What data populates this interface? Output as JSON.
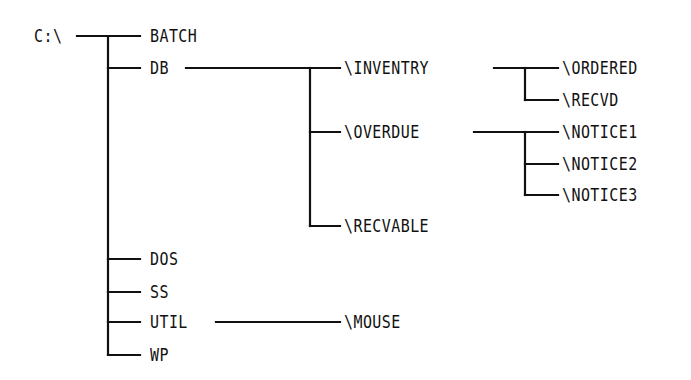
{
  "diagram": {
    "type": "directory-tree",
    "root": {
      "label": "C:\\",
      "x": 34,
      "y": 36
    },
    "nodes": [
      {
        "id": "batch",
        "label": "BATCH",
        "x": 150,
        "y": 36
      },
      {
        "id": "db",
        "label": "DB",
        "x": 150,
        "y": 68
      },
      {
        "id": "inventry",
        "label": "\\INVENTRY",
        "x": 344,
        "y": 68
      },
      {
        "id": "ordered",
        "label": "\\ORDERED",
        "x": 562,
        "y": 68
      },
      {
        "id": "recvd",
        "label": "\\RECVD",
        "x": 562,
        "y": 100
      },
      {
        "id": "overdue",
        "label": "\\OVERDUE",
        "x": 344,
        "y": 132
      },
      {
        "id": "notice1",
        "label": "\\NOTICE1",
        "x": 562,
        "y": 132
      },
      {
        "id": "notice2",
        "label": "\\NOTICE2",
        "x": 562,
        "y": 164
      },
      {
        "id": "notice3",
        "label": "\\NOTICE3",
        "x": 562,
        "y": 195
      },
      {
        "id": "recvable",
        "label": "\\RECVABLE",
        "x": 344,
        "y": 226
      },
      {
        "id": "dos",
        "label": "DOS",
        "x": 150,
        "y": 259
      },
      {
        "id": "ss",
        "label": "SS",
        "x": 150,
        "y": 292
      },
      {
        "id": "util",
        "label": "UTIL",
        "x": 150,
        "y": 322
      },
      {
        "id": "mouse",
        "label": "\\MOUSE",
        "x": 344,
        "y": 322
      },
      {
        "id": "wp",
        "label": "WP",
        "x": 150,
        "y": 355
      }
    ],
    "edges": [
      {
        "from": "C:\\",
        "to": "BATCH"
      },
      {
        "from": "C:\\",
        "to": "DB"
      },
      {
        "from": "C:\\",
        "to": "DOS"
      },
      {
        "from": "C:\\",
        "to": "SS"
      },
      {
        "from": "C:\\",
        "to": "UTIL"
      },
      {
        "from": "C:\\",
        "to": "WP"
      },
      {
        "from": "DB",
        "to": "\\INVENTRY"
      },
      {
        "from": "DB",
        "to": "\\OVERDUE"
      },
      {
        "from": "DB",
        "to": "\\RECVABLE"
      },
      {
        "from": "\\INVENTRY",
        "to": "\\ORDERED"
      },
      {
        "from": "\\INVENTRY",
        "to": "\\RECVD"
      },
      {
        "from": "\\OVERDUE",
        "to": "\\NOTICE1"
      },
      {
        "from": "\\OVERDUE",
        "to": "\\NOTICE2"
      },
      {
        "from": "\\OVERDUE",
        "to": "\\NOTICE3"
      },
      {
        "from": "UTIL",
        "to": "\\MOUSE"
      }
    ],
    "line_color": "#111111",
    "text_color": "#111111",
    "background": "#ffffff"
  }
}
